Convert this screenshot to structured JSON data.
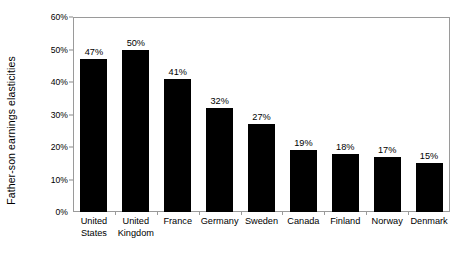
{
  "chart_data": {
    "type": "bar",
    "title": "",
    "subtitle": "",
    "xlabel": "",
    "ylabel": "Father-son earnings elasticities",
    "ylim": [
      0,
      60
    ],
    "y_tick_values": [
      0,
      10,
      20,
      30,
      40,
      50,
      60
    ],
    "y_tick_labels": [
      "0%",
      "10%",
      "20%",
      "30%",
      "40%",
      "50%",
      "60%"
    ],
    "grid": false,
    "legend": null,
    "value_label_suffix": "%",
    "bar_color": "#000000",
    "frame_color": "#9a9a9a",
    "categories": [
      "United States",
      "United Kingdom",
      "France",
      "Germany",
      "Sweden",
      "Canada",
      "Finland",
      "Norway",
      "Denmark"
    ],
    "category_label_lines": [
      [
        "United",
        "States"
      ],
      [
        "United",
        "Kingdom"
      ],
      [
        "France"
      ],
      [
        "Germany"
      ],
      [
        "Sweden"
      ],
      [
        "Canada"
      ],
      [
        "Finland"
      ],
      [
        "Norway"
      ],
      [
        "Denmark"
      ]
    ],
    "values": [
      47,
      50,
      41,
      32,
      27,
      19,
      18,
      17,
      15
    ],
    "value_labels": [
      "47%",
      "50%",
      "41%",
      "32%",
      "27%",
      "19%",
      "18%",
      "17%",
      "15%"
    ]
  }
}
